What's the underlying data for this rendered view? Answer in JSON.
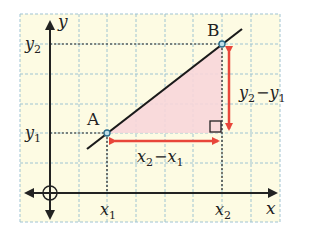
{
  "diagram": {
    "colors": {
      "grid_bg": "#fdfbe3",
      "grid_line": "#9fc4d2",
      "axis": "#222222",
      "line": "#1a1a1a",
      "triangle_fill": "#f8d6d9",
      "arrow": "#e8463a",
      "point": "#2c6d8a"
    },
    "axes": {
      "x_label": "x",
      "y_label": "y",
      "origin_marker": "circle-crosshair"
    },
    "points": [
      {
        "name": "A",
        "label": "A",
        "x_label": "x",
        "x_sub": "1",
        "y_label": "y",
        "y_sub": "1"
      },
      {
        "name": "B",
        "label": "B",
        "x_label": "x",
        "x_sub": "2",
        "y_label": "y",
        "y_sub": "2"
      }
    ],
    "tick_labels": {
      "x1": {
        "main": "x",
        "sub": "1"
      },
      "x2": {
        "main": "x",
        "sub": "2"
      },
      "y1": {
        "main": "y",
        "sub": "1"
      },
      "y2": {
        "main": "y",
        "sub": "2"
      }
    },
    "run_label": {
      "a": "x",
      "a_sub": "2",
      "op": "−",
      "b": "x",
      "b_sub": "1"
    },
    "rise_label": {
      "a": "y",
      "a_sub": "2",
      "op": "−",
      "b": "y",
      "b_sub": "1"
    },
    "right_angle_marker": "square"
  }
}
